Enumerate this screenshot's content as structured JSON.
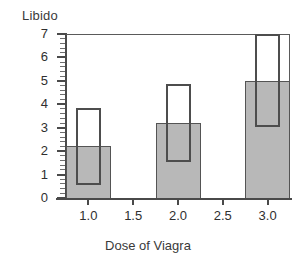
{
  "chart_data": {
    "type": "bar",
    "title": "",
    "subtitle": "",
    "xlabel": "Dose of Viagra",
    "ylabel": "Libido",
    "categories": [
      "1.0",
      "2.0",
      "3.0"
    ],
    "x": [
      1.0,
      2.0,
      3.0
    ],
    "values": [
      2.2,
      3.2,
      5.0
    ],
    "series": [
      {
        "name": "Mean libido",
        "values": [
          2.2,
          3.2,
          5.0
        ]
      }
    ],
    "error_boxes": [
      {
        "x": 1.0,
        "lower": 0.55,
        "upper": 3.85
      },
      {
        "x": 2.0,
        "lower": 1.55,
        "upper": 4.85
      },
      {
        "x": 3.0,
        "lower": 3.05,
        "upper": 7.0
      }
    ],
    "xlim": [
      0.75,
      3.25
    ],
    "ylim": [
      0,
      7
    ],
    "xticks": [
      "1.0",
      "1.5",
      "2.0",
      "2.5",
      "3.0"
    ],
    "xtick_values": [
      1.0,
      1.5,
      2.0,
      2.5,
      3.0
    ],
    "yticks": [
      "0",
      "1",
      "2",
      "3",
      "4",
      "5",
      "6",
      "7"
    ],
    "ytick_values": [
      0,
      1,
      2,
      3,
      4,
      5,
      6,
      7
    ],
    "y_minor_tick_step": 0.2,
    "grid": false,
    "legend": null,
    "legend_position": "none",
    "bar_fill_color": "#b8b8b8",
    "bar_edge_color": "#545454",
    "errorbox_fill_color": "#ffffff",
    "errorbox_edge_color": "#4d4d4d",
    "axis_color": "#4a4a4a",
    "background_color": "#ffffff"
  }
}
